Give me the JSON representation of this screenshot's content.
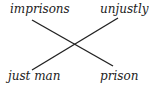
{
  "diagram": {
    "type": "chiasmus",
    "words": {
      "top_left": "imprisons",
      "top_right": "unjustly",
      "bottom_left": "just man",
      "bottom_right": "prison"
    },
    "connections": [
      {
        "from": "top_left",
        "to": "bottom_right"
      },
      {
        "from": "top_right",
        "to": "bottom_left"
      }
    ],
    "line_color": "#222222"
  }
}
